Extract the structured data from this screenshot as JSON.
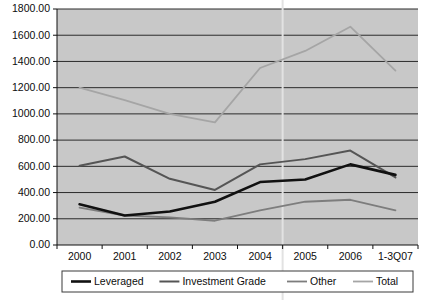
{
  "chart_data": {
    "type": "line",
    "title": "",
    "subtitle": "",
    "xlabel": "",
    "ylabel": "",
    "categories": [
      "2000",
      "2001",
      "2002",
      "2003",
      "2004",
      "2005",
      "2006",
      "1-3Q07"
    ],
    "ylim": [
      0,
      1800
    ],
    "ytick_labels": [
      "0.00",
      "200.00",
      "400.00",
      "600.00",
      "800.00",
      "1000.00",
      "1200.00",
      "1400.00",
      "1600.00",
      "1800.00"
    ],
    "ytick_values": [
      0,
      200,
      400,
      600,
      800,
      1000,
      1200,
      1400,
      1600,
      1800
    ],
    "grid": true,
    "grid_axis": "y",
    "legend_position": "bottom",
    "plot_background": "#c8c8c8",
    "series": [
      {
        "name": "Leveraged",
        "color": "#111111",
        "width": 2.6,
        "values": [
          310,
          225,
          255,
          330,
          480,
          500,
          615,
          535
        ]
      },
      {
        "name": "Investment Grade",
        "color": "#555555",
        "width": 2.0,
        "values": [
          605,
          675,
          505,
          420,
          615,
          655,
          720,
          515
        ]
      },
      {
        "name": "Other",
        "color": "#7d7d7d",
        "width": 1.8,
        "values": [
          285,
          225,
          210,
          185,
          265,
          330,
          345,
          265
        ]
      },
      {
        "name": "Total",
        "color": "#a5a5a5",
        "width": 1.8,
        "values": [
          1200,
          1105,
          1000,
          935,
          1350,
          1480,
          1665,
          1330
        ]
      }
    ],
    "annotations": [
      {
        "kind": "vertical-line",
        "label": "forecast-divider",
        "between": [
          "2004",
          "2005"
        ],
        "color": "#e2e2e2"
      }
    ]
  },
  "legend": {
    "items": [
      {
        "label": "Leveraged"
      },
      {
        "label": "Investment Grade"
      },
      {
        "label": "Other"
      },
      {
        "label": "Total"
      }
    ]
  }
}
